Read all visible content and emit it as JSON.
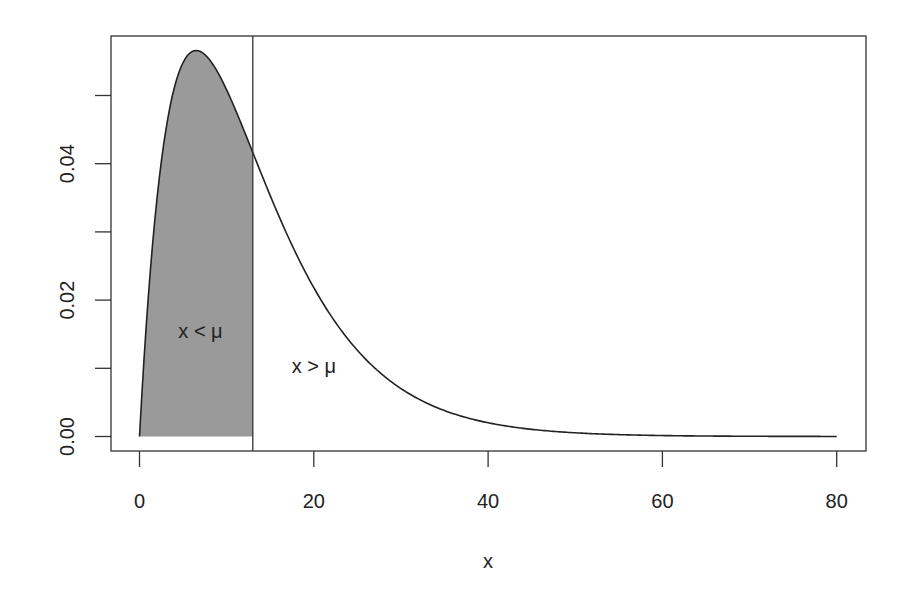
{
  "chart_data": {
    "type": "area",
    "title": "",
    "xlabel": "x",
    "ylabel": "",
    "xlim": [
      0,
      80
    ],
    "ylim": [
      0,
      0.0566
    ],
    "grid": false,
    "legend": null,
    "x_ticks": [
      0,
      20,
      40,
      60,
      80
    ],
    "x_tick_labels": [
      "0",
      "20",
      "40",
      "60",
      "80"
    ],
    "y_ticks": [
      0,
      0.01,
      0.02,
      0.03,
      0.04,
      0.05
    ],
    "y_tick_labels": [
      "0.00",
      "",
      "0.02",
      "",
      "0.04",
      ""
    ],
    "distribution": "Gamma(shape=2, scale=6.5), mean mu = 13",
    "mu": 13,
    "series": [
      {
        "name": "density",
        "x": [
          0,
          1,
          2,
          3,
          4,
          5,
          6,
          6.5,
          7,
          8,
          9,
          10,
          11,
          12,
          13,
          14,
          15,
          16,
          18,
          20,
          22,
          24,
          26,
          28,
          30,
          32,
          35,
          40,
          45,
          50,
          60,
          70,
          80
        ],
        "y": [
          0,
          0.02021,
          0.03488,
          0.0446,
          0.051,
          0.05476,
          0.05647,
          0.0566,
          0.0565,
          0.05562,
          0.05353,
          0.05076,
          0.04767,
          0.04441,
          0.04119,
          0.03822,
          0.0352,
          0.03227,
          0.02678,
          0.0218,
          0.01758,
          0.01404,
          0.0111,
          0.00872,
          0.0068,
          0.00527,
          0.00374,
          0.00201,
          0.00104,
          0.000538,
          0.000133,
          3.18e-05,
          7.4e-06
        ]
      }
    ],
    "shaded_region": {
      "from": 0,
      "to": 13,
      "color": "#9a9a9a"
    },
    "vertical_line": {
      "x": 13,
      "color": "#333333"
    },
    "annotations": [
      {
        "text": "x < μ",
        "x": 7,
        "y": 0.0155
      },
      {
        "text": "x > μ",
        "x": 20,
        "y": 0.0103
      }
    ],
    "colors": {
      "line": "#222222",
      "fill": "#9a9a9a",
      "axis": "#333333"
    }
  }
}
